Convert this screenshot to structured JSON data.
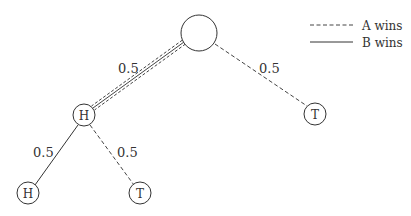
{
  "diagram": {
    "type": "probability-tree",
    "legend": {
      "a_label": "A wins",
      "a_style": "dashed",
      "b_label": "B wins",
      "b_style": "solid"
    },
    "nodes": {
      "root": {
        "label": ""
      },
      "h1": {
        "label": "H"
      },
      "t1": {
        "label": "T"
      },
      "hh": {
        "label": "H"
      },
      "ht": {
        "label": "T"
      }
    },
    "edges": {
      "root_h1": {
        "prob": "0.5",
        "style": "double"
      },
      "root_t1": {
        "prob": "0.5",
        "style": "dashed"
      },
      "h1_hh": {
        "prob": "0.5",
        "style": "solid"
      },
      "h1_ht": {
        "prob": "0.5",
        "style": "dashed"
      }
    },
    "colors": {
      "line": "#333333",
      "background": "#ffffff"
    }
  }
}
